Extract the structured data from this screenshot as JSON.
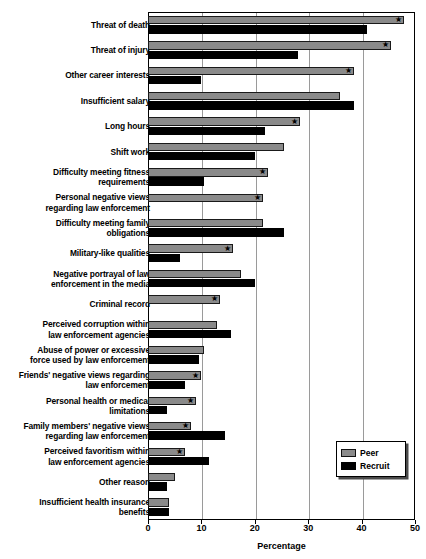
{
  "chart_data": {
    "type": "bar",
    "orientation": "horizontal",
    "title": "",
    "xlabel": "Percentage",
    "ylabel": "",
    "xlim": [
      0,
      50
    ],
    "xticks": [
      0,
      10,
      20,
      30,
      40,
      50
    ],
    "grid": true,
    "legend_position": "bottom-right",
    "significance_marker": "★",
    "significance_note": "Asterisk marks Peer bars with a statistically significant difference",
    "categories": [
      "Threat of death",
      "Threat of injury",
      "Other career interests",
      "Insufficient salary",
      "Long hours",
      "Shift work",
      "Difficulty meeting fitness\nrequirements",
      "Personal negative views\nregarding law enforcement",
      "Difficulty meeting family\nobligations",
      "Military-like qualities",
      "Negative portrayal of law\nenforcement in the media",
      "Criminal record",
      "Perceived corruption within\nlaw enforcement agencies",
      "Abuse of power or excessive\nforce used by law enforcement",
      "Friends' negative views regarding\nlaw enforcement",
      "Personal health or medical\nlimitations",
      "Family members' negative views\nregarding law enforcement",
      "Perceived favoritism within\nlaw enforcement agencies",
      "Other reason",
      "Insufficient health insurance\nbenefits"
    ],
    "series": [
      {
        "name": "Peer",
        "color": "#8a8a8a",
        "values": [
          48.0,
          45.5,
          38.5,
          36.0,
          28.5,
          25.5,
          22.5,
          21.5,
          21.5,
          16.0,
          17.5,
          13.5,
          13.0,
          10.5,
          10.0,
          9.0,
          8.0,
          7.0,
          5.0,
          4.0
        ],
        "significant": [
          true,
          true,
          true,
          false,
          true,
          false,
          true,
          true,
          false,
          true,
          false,
          true,
          false,
          false,
          true,
          true,
          true,
          true,
          false,
          false
        ]
      },
      {
        "name": "Recruit",
        "color": "#000000",
        "values": [
          41.0,
          28.0,
          10.0,
          38.5,
          22.0,
          20.0,
          10.5,
          0.0,
          25.5,
          6.0,
          20.0,
          0.0,
          15.5,
          9.5,
          7.0,
          3.5,
          14.5,
          11.5,
          3.5,
          4.0
        ],
        "significant": [
          false,
          false,
          false,
          false,
          false,
          false,
          false,
          false,
          false,
          false,
          false,
          false,
          false,
          false,
          false,
          false,
          false,
          false,
          false,
          false
        ]
      }
    ]
  },
  "legend": {
    "items": [
      {
        "label": "Peer"
      },
      {
        "label": "Recruit"
      }
    ]
  },
  "axis": {
    "x_title": "Percentage",
    "tick_labels": [
      "0",
      "10",
      "20",
      "30",
      "40",
      "50"
    ]
  }
}
